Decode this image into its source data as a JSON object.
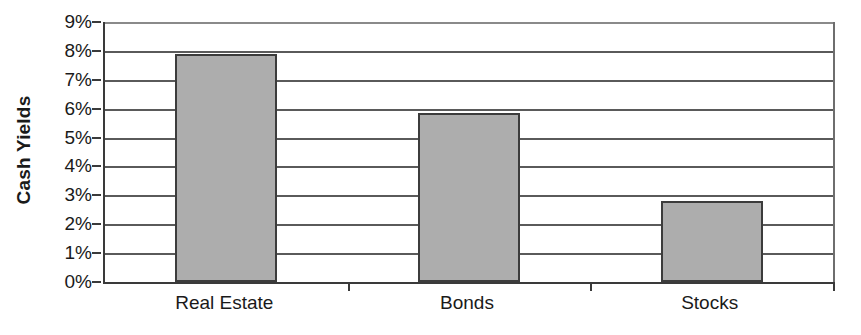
{
  "chart_data": {
    "type": "bar",
    "title": "",
    "subtitle": "",
    "xlabel": "",
    "ylabel": "Cash Yields",
    "categories": [
      "Real Estate",
      "Bonds",
      "Stocks"
    ],
    "values": [
      7.9,
      5.85,
      2.8
    ],
    "series": [
      {
        "name": "Cash Yields",
        "values": [
          7.9,
          5.85,
          2.8
        ]
      }
    ],
    "ylim": [
      0,
      9
    ],
    "ytick_values": [
      0,
      1,
      2,
      3,
      4,
      5,
      6,
      7,
      8,
      9
    ],
    "ytick_labels": [
      "0%",
      "1%",
      "2%",
      "3%",
      "4%",
      "5%",
      "6%",
      "7%",
      "8%",
      "9%"
    ],
    "grid": "horizontal",
    "legend": "none",
    "annotations": [],
    "colors": {
      "bar_fill": "#adadad",
      "bar_border": "#3c3c3c",
      "gridline": "#5a5a5a",
      "axis": "#3a3a3a",
      "text": "#1a1a1a",
      "background": "#ffffff"
    }
  }
}
